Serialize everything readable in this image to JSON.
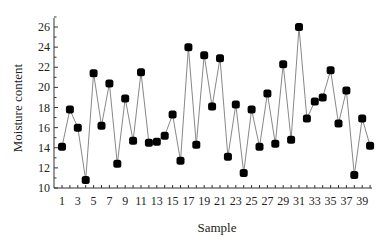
{
  "chart_data": {
    "type": "line",
    "title": "",
    "xlabel": "Sample",
    "ylabel": "Moisture content",
    "xlim": [
      1,
      40
    ],
    "ylim": [
      10,
      27
    ],
    "x_tick_labels": [
      "1",
      "3",
      "5",
      "7",
      "9",
      "11",
      "13",
      "15",
      "17",
      "19",
      "21",
      "23",
      "25",
      "27",
      "29",
      "31",
      "33",
      "35",
      "37",
      "39"
    ],
    "y_tick_labels": [
      "10",
      "12",
      "14",
      "16",
      "18",
      "20",
      "22",
      "24",
      "26"
    ],
    "grid": false,
    "legend": null,
    "marker": "filled-square-rounded",
    "colors": {
      "line": "#888888",
      "marker": "#000000",
      "axis": "#333333"
    },
    "x": [
      1,
      2,
      3,
      4,
      5,
      6,
      7,
      8,
      9,
      10,
      11,
      12,
      13,
      14,
      15,
      16,
      17,
      18,
      19,
      20,
      21,
      22,
      23,
      24,
      25,
      26,
      27,
      28,
      29,
      30,
      31,
      32,
      33,
      34,
      35,
      36,
      37,
      38,
      39,
      40
    ],
    "series": [
      {
        "name": "Moisture content",
        "values": [
          14.1,
          17.8,
          16.0,
          10.8,
          21.4,
          16.2,
          20.4,
          12.4,
          18.9,
          14.7,
          21.5,
          14.5,
          14.6,
          15.2,
          17.3,
          12.7,
          24.0,
          14.3,
          23.2,
          18.1,
          22.9,
          13.1,
          18.3,
          11.5,
          17.8,
          14.1,
          19.4,
          14.4,
          22.3,
          14.8,
          26.0,
          16.9,
          18.6,
          19.0,
          21.7,
          16.4,
          19.7,
          11.3,
          16.9,
          14.2
        ]
      }
    ]
  }
}
